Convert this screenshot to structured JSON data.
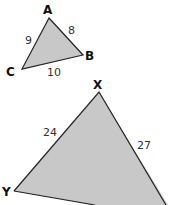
{
  "colors": {
    "fill": "#c8c8c8",
    "stroke": "#222222"
  },
  "small_triangle": {
    "vertices": {
      "A": "A",
      "B": "B",
      "C": "C"
    },
    "sides": {
      "AC": "9",
      "AB": "8",
      "CB": "10"
    }
  },
  "large_triangle": {
    "vertices": {
      "X": "X",
      "Y": "Y"
    },
    "sides": {
      "XY": "24",
      "XZ": "27"
    }
  }
}
